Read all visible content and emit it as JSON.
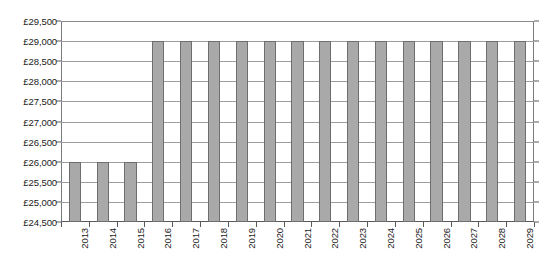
{
  "chart_data": {
    "type": "bar",
    "title": "",
    "xlabel": "",
    "ylabel": "",
    "ylim": [
      24500,
      29500
    ],
    "ytick_step": 500,
    "ytick_labels": [
      "£29,500",
      "£29,000",
      "£28,500",
      "£28,000",
      "£27,500",
      "£27,000",
      "£26,500",
      "£26,000",
      "£25,500",
      "£25,000",
      "£24,500"
    ],
    "ytick_values": [
      29500,
      29000,
      28500,
      28000,
      27500,
      27000,
      26500,
      26000,
      25500,
      25000,
      24500
    ],
    "grid": true,
    "legend": false,
    "categories": [
      "2013",
      "2014",
      "2015",
      "2016",
      "2017",
      "2018",
      "2019",
      "2020",
      "2021",
      "2022",
      "2023",
      "2024",
      "2025",
      "2026",
      "2027",
      "2028",
      "2029"
    ],
    "values": [
      26000,
      26000,
      26000,
      29000,
      29000,
      29000,
      29000,
      29000,
      29000,
      29000,
      29000,
      29000,
      29000,
      29000,
      29000,
      29000,
      29000
    ],
    "currency_symbol": "£",
    "bar_color": "#a9a9a9",
    "bar_edge_color": "#6e6e6e",
    "grid_color": "#9d9d9d",
    "axis_color": "#5a5a5a",
    "xlabel_rotation": 90
  }
}
